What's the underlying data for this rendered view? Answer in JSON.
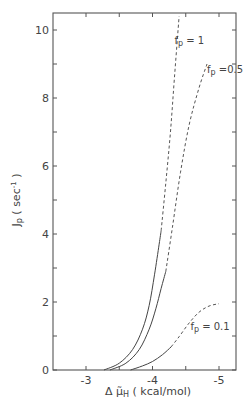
{
  "chart_data": {
    "type": "line",
    "title": "",
    "xlabel": "Δμ̃H (kcal/mol)",
    "ylabel": "Jp (sec⁻¹)",
    "xlim": [
      -2.5,
      -5.25
    ],
    "ylim": [
      0,
      10.5
    ],
    "x_ticks": [
      -3,
      -3.5,
      -4,
      -4.5,
      -5
    ],
    "x_tick_labels": [
      "-3",
      "",
      "-4",
      "",
      "-5"
    ],
    "y_ticks": [
      0,
      1,
      2,
      3,
      4,
      5,
      6,
      7,
      8,
      9,
      10
    ],
    "y_tick_labels": [
      "0",
      "",
      "2",
      "",
      "4",
      "",
      "6",
      "",
      "8",
      "",
      "10"
    ],
    "grid": false,
    "legend": "inline labels",
    "series": [
      {
        "name": "fp = 1",
        "label_sub": "p",
        "label_main": "f",
        "label_value": "= 1",
        "label_pos": [
          -4.33,
          9.6
        ],
        "solid": [
          [
            -3.27,
            0
          ],
          [
            -3.5,
            0.2
          ],
          [
            -3.7,
            0.6
          ],
          [
            -3.85,
            1.2
          ],
          [
            -3.95,
            1.9
          ],
          [
            -4.03,
            2.8
          ],
          [
            -4.1,
            3.7
          ],
          [
            -4.13,
            4.1
          ]
        ],
        "dashed": [
          [
            -4.13,
            4.1
          ],
          [
            -4.2,
            5.5
          ],
          [
            -4.27,
            7.0
          ],
          [
            -4.33,
            8.6
          ],
          [
            -4.4,
            10.4
          ]
        ]
      },
      {
        "name": "fp = 0.5",
        "label_main": "f",
        "label_sub": "p",
        "label_value": "=0.5",
        "label_pos": [
          -4.82,
          8.75
        ],
        "solid": [
          [
            -3.36,
            0
          ],
          [
            -3.6,
            0.2
          ],
          [
            -3.8,
            0.6
          ],
          [
            -3.95,
            1.2
          ],
          [
            -4.05,
            1.8
          ],
          [
            -4.13,
            2.4
          ],
          [
            -4.2,
            2.9
          ]
        ],
        "dashed": [
          [
            -4.2,
            2.9
          ],
          [
            -4.3,
            4.2
          ],
          [
            -4.42,
            5.8
          ],
          [
            -4.55,
            7.2
          ],
          [
            -4.7,
            8.3
          ],
          [
            -4.82,
            9.0
          ]
        ]
      },
      {
        "name": "fp = 0.1",
        "label_main": "f",
        "label_sub": "p",
        "label_value": "= 0.1",
        "label_pos": [
          -4.57,
          1.18
        ],
        "solid": [
          [
            -3.67,
            0
          ],
          [
            -3.85,
            0.12
          ],
          [
            -4.0,
            0.25
          ],
          [
            -4.15,
            0.45
          ],
          [
            -4.28,
            0.68
          ]
        ],
        "dashed": [
          [
            -4.28,
            0.68
          ],
          [
            -4.4,
            0.98
          ],
          [
            -4.55,
            1.38
          ],
          [
            -4.7,
            1.7
          ],
          [
            -4.85,
            1.88
          ],
          [
            -5.0,
            1.95
          ]
        ]
      }
    ]
  },
  "axes": {
    "x_title_prefix": "Δ μ̃",
    "x_title_sub": "H",
    "x_title_suffix": " ( kcal/mol)",
    "y_title_main": "J",
    "y_title_sub": "p",
    "y_title_suffix": " ( sec",
    "y_title_sup": "-1",
    "y_title_close": " )"
  }
}
